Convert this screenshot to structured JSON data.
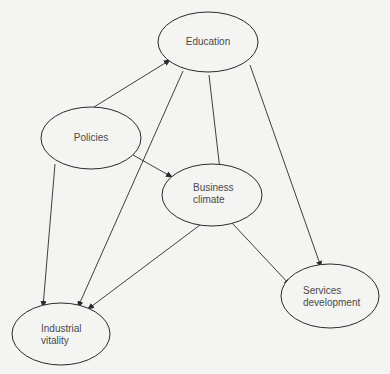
{
  "diagram": {
    "type": "causal-influence-diagram",
    "nodes": [
      {
        "id": "education",
        "label_lines": [
          "Education"
        ]
      },
      {
        "id": "policies",
        "label_lines": [
          "Policies"
        ]
      },
      {
        "id": "business_climate",
        "label_lines": [
          "Business",
          "climate"
        ]
      },
      {
        "id": "services_development",
        "label_lines": [
          "Services",
          "development"
        ]
      },
      {
        "id": "industrial_vitality",
        "label_lines": [
          "Industrial",
          "vitality"
        ]
      }
    ],
    "edges": [
      {
        "from": "policies",
        "to": "education"
      },
      {
        "from": "policies",
        "to": "business_climate"
      },
      {
        "from": "policies",
        "to": "industrial_vitality"
      },
      {
        "from": "education",
        "to": "business_climate"
      },
      {
        "from": "education",
        "to": "industrial_vitality"
      },
      {
        "from": "education",
        "to": "services_development"
      },
      {
        "from": "business_climate",
        "to": "industrial_vitality"
      },
      {
        "from": "business_climate",
        "to": "services_development"
      }
    ]
  }
}
